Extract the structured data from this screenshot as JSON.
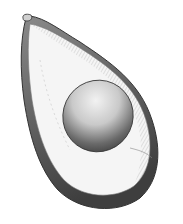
{
  "image": {
    "subject": "avocado-half-illustration",
    "style": "pen-and-ink hatching",
    "colors": {
      "background": "#ffffff",
      "ink": "#3a3a3a",
      "skin_dark": "#4a4a4a",
      "flesh": "#f4f4f4",
      "pit_light": "#e8e8e8",
      "pit_dark": "#505050"
    }
  }
}
